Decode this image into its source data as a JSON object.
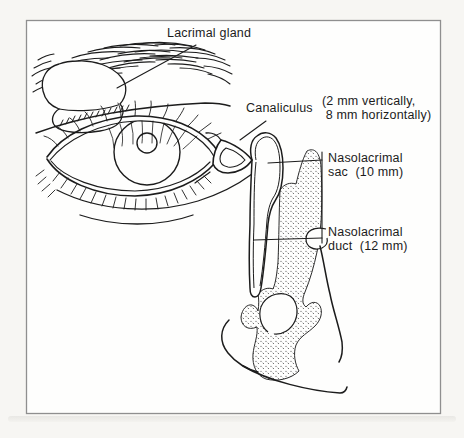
{
  "figure": {
    "type": "anatomical-line-diagram",
    "colors": {
      "line": "#1c1c1c",
      "frame": "#8f8f8f",
      "paper": "#fefefd",
      "stipple_dot": "#3a3a3a"
    },
    "labels": {
      "lacrimal_gland": "Lacrimal gland",
      "canaliculus": "Canaliculus",
      "canaliculus_dims": "(2 mm vertically,\n 8 mm horizontally)",
      "nasolacrimal_sac": "Nasolacrimal\nsac  (10 mm)",
      "nasolacrimal_duct": "Nasolacrimal\nduct  (12 mm)"
    }
  }
}
